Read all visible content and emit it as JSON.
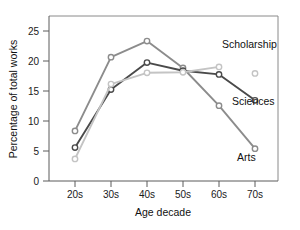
{
  "chart_data": {
    "type": "line",
    "title": "",
    "xlabel": "Age decade",
    "ylabel": "Percentage of total works",
    "categories": [
      "20s",
      "30s",
      "40s",
      "50s",
      "60s",
      "70s"
    ],
    "xtick_labels": [
      "20s",
      "30s",
      "40s",
      "50s",
      "60s",
      "70s"
    ],
    "ytick_labels": [
      "0",
      "5",
      "10",
      "15",
      "20",
      "25"
    ],
    "yticks": [
      0,
      5,
      10,
      15,
      20,
      25
    ],
    "ylim": [
      0,
      27.5
    ],
    "grid": false,
    "legend_position": "inline-right",
    "series": [
      {
        "name": "Arts",
        "color": "#8c8c8c",
        "values": [
          9.3,
          23.0,
          26.0,
          21.0,
          14.0,
          6.0
        ],
        "label_text": "Arts"
      },
      {
        "name": "Sciences",
        "color": "#4a4a4a",
        "values": [
          6.2,
          17.0,
          22.0,
          20.5,
          19.8,
          15.0
        ],
        "label_text": "Sciences"
      },
      {
        "name": "Scholarship",
        "color": "#c4c4c4",
        "values": [
          4.1,
          18.0,
          20.1,
          20.2,
          21.2,
          20.0
        ],
        "label_text": "Scholarship",
        "note": "last point drawn as isolated marker"
      }
    ]
  },
  "labels": {
    "scholarship": "Scholarship",
    "sciences": "Sciences",
    "arts": "Arts",
    "x_axis_title": "Age decade",
    "y_axis_title": "Percentage of total works"
  }
}
